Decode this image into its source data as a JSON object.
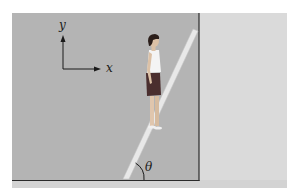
{
  "figure": {
    "axes": {
      "x_label": "x",
      "y_label": "y"
    },
    "angle_label": "θ"
  },
  "colors": {
    "panel": "#b3b3b3",
    "panel_right": "#d9d9d9",
    "floor_strip": "#cfcfcf",
    "wall_line": "#2a2a2a",
    "ladder": "#e6e6e6",
    "ladder_edge": "#c8c8c8",
    "skin": "#e2c9b0",
    "shorts": "#4a2f2f",
    "shirt": "#f5f5f5",
    "hair": "#2b1e1a"
  }
}
